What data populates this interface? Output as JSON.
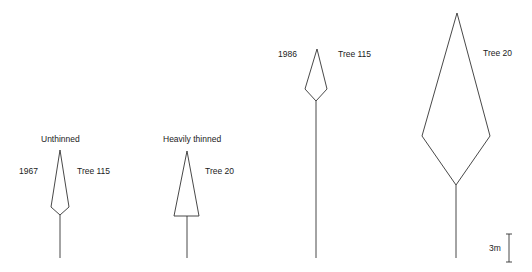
{
  "diagram": {
    "type": "tree-crown-profiles",
    "trees": [
      {
        "id": "tree-1",
        "title": "Unthinned",
        "year": "1967",
        "label": "Tree 115",
        "apex": [
          60,
          150
        ],
        "left": [
          51,
          207
        ],
        "right": [
          69,
          207
        ],
        "crown_base": [
          60,
          215
        ],
        "ground": 258,
        "shape": "diamond"
      },
      {
        "id": "tree-2",
        "title": "Heavily thinned",
        "year": "",
        "label": "Tree 20",
        "apex": [
          187,
          151
        ],
        "left": [
          174,
          216
        ],
        "right": [
          199,
          216
        ],
        "crown_base": [
          187,
          216
        ],
        "ground": 258,
        "shape": "triangle"
      },
      {
        "id": "tree-3",
        "title": "",
        "year": "1986",
        "label": "Tree 115",
        "apex": [
          317,
          49
        ],
        "left": [
          305,
          89
        ],
        "right": [
          327,
          89
        ],
        "crown_base": [
          316,
          101
        ],
        "ground": 258,
        "shape": "diamond"
      },
      {
        "id": "tree-4",
        "title": "",
        "year": "",
        "label": "Tree 20",
        "apex": [
          457,
          13
        ],
        "left": [
          422,
          136
        ],
        "right": [
          490,
          136
        ],
        "crown_base": [
          456,
          185
        ],
        "ground": 258,
        "shape": "diamond"
      }
    ],
    "scale_bar": {
      "label": "3m"
    }
  }
}
